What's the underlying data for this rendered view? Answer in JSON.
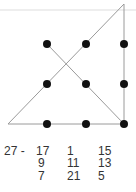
{
  "diagram": {
    "dots": [
      {
        "x": 47,
        "y": 44
      },
      {
        "x": 86,
        "y": 44
      },
      {
        "x": 124,
        "y": 44
      },
      {
        "x": 47,
        "y": 84
      },
      {
        "x": 86,
        "y": 84
      },
      {
        "x": 124,
        "y": 84
      },
      {
        "x": 47,
        "y": 124
      },
      {
        "x": 86,
        "y": 124
      },
      {
        "x": 124,
        "y": 124
      }
    ],
    "lines": [
      {
        "x1": 8,
        "y1": 124,
        "x2": 124,
        "y2": 4
      },
      {
        "x1": 124,
        "y1": 4,
        "x2": 124,
        "y2": 124
      },
      {
        "x1": 124,
        "y1": 124,
        "x2": 47,
        "y2": 44
      },
      {
        "x1": 8,
        "y1": 124,
        "x2": 124,
        "y2": 124
      }
    ],
    "colors": {
      "dot": "#111111",
      "line": "#9a9a9a",
      "rule": "#dddddd"
    }
  },
  "magic_square": {
    "label": "27 -",
    "rows": [
      [
        "17",
        "1",
        "15"
      ],
      [
        "9",
        "11",
        "13"
      ],
      [
        "7",
        "21",
        "5"
      ]
    ]
  }
}
